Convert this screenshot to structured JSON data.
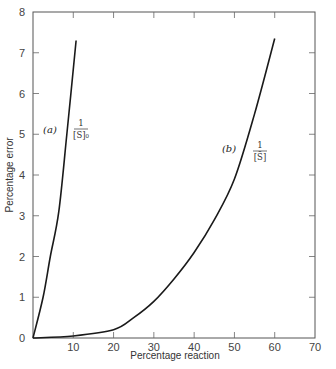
{
  "chart_data": {
    "type": "line",
    "title": "",
    "xlabel": "Percentage reaction",
    "ylabel": "Percentage error",
    "xlim": [
      0,
      70
    ],
    "ylim": [
      0,
      8
    ],
    "xticks": [
      10,
      20,
      30,
      40,
      50,
      60,
      70
    ],
    "yticks": [
      0,
      1,
      2,
      3,
      4,
      5,
      6,
      7,
      8
    ],
    "grid": false,
    "legend": "none (inline curve labels)",
    "series": [
      {
        "name": "(a) 1/[S]0",
        "label": "(a)",
        "annotation_num": "1",
        "annotation_den": "[S]₀",
        "x": [
          0,
          2.5,
          4.3,
          6.4,
          8.4,
          10.7
        ],
        "y": [
          0,
          1.0,
          2.0,
          3.1,
          5.0,
          7.3
        ]
      },
      {
        "name": "(b) 1/[S̄]",
        "label": "(b)",
        "annotation_num": "1",
        "annotation_den": "[S̄]",
        "x": [
          0,
          10,
          20,
          25,
          30,
          35,
          40,
          45,
          50,
          55,
          60
        ],
        "y": [
          0,
          0.05,
          0.2,
          0.5,
          0.9,
          1.45,
          2.1,
          2.9,
          3.9,
          5.5,
          7.35
        ]
      }
    ]
  }
}
